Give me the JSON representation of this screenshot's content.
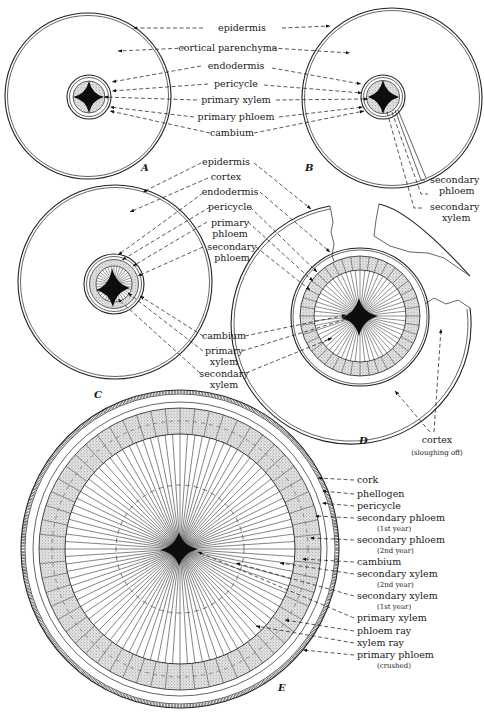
{
  "figure": {
    "panels": [
      {
        "letter": "A",
        "title": "Young root, primary structure"
      },
      {
        "letter": "B",
        "title": "Root with beginning secondary growth"
      },
      {
        "letter": "C",
        "title": "Root with cambium ring formed"
      },
      {
        "letter": "D",
        "title": "Root with cortex sloughing off"
      },
      {
        "letter": "E",
        "title": "Root in second year"
      }
    ],
    "labels_ab": [
      "epidermis",
      "cortical parenchyma",
      "endodermis",
      "pericycle",
      "primary xylem",
      "primary phloem",
      "cambium"
    ],
    "labels_b_right": [
      {
        "line1": "secondary",
        "line2": "phloem"
      },
      {
        "line1": "secondary",
        "line2": "xylem"
      }
    ],
    "labels_cd": [
      {
        "line1": "epidermis",
        "line2": ""
      },
      {
        "line1": "cortex",
        "line2": ""
      },
      {
        "line1": "endodermis",
        "line2": ""
      },
      {
        "line1": "pericycle",
        "line2": ""
      },
      {
        "line1": "primary",
        "line2": "phloem"
      },
      {
        "line1": "secondary",
        "line2": "phloem"
      },
      {
        "line1": "cambium",
        "line2": ""
      },
      {
        "line1": "primary",
        "line2": "xylem"
      },
      {
        "line1": "secondary",
        "line2": "xylem"
      }
    ],
    "label_d_cortex": {
      "line1": "cortex",
      "line2": "(sloughing off)"
    },
    "labels_e": [
      {
        "line1": "cork",
        "line2": ""
      },
      {
        "line1": "phellogen",
        "line2": ""
      },
      {
        "line1": "pericycle",
        "line2": ""
      },
      {
        "line1": "secondary phloem",
        "line2": "(1st year)"
      },
      {
        "line1": "secondary phloem",
        "line2": "(2nd year)"
      },
      {
        "line1": "cambium",
        "line2": ""
      },
      {
        "line1": "secondary xylem",
        "line2": "(2nd year)"
      },
      {
        "line1": "secondary xylem",
        "line2": "(1st year)"
      },
      {
        "line1": "primary xylem",
        "line2": ""
      },
      {
        "line1": "phloem ray",
        "line2": ""
      },
      {
        "line1": "xylem ray",
        "line2": ""
      },
      {
        "line1": "primary phloem",
        "line2": "(crushed)"
      }
    ]
  }
}
